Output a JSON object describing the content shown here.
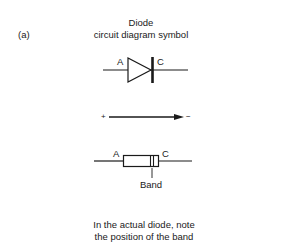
{
  "panel_label": "(a)",
  "title": {
    "line1": "Diode",
    "line2": "circuit diagram symbol"
  },
  "symbol": {
    "anode_label": "A",
    "cathode_label": "C"
  },
  "direction_arrow": {
    "plus_label": "+",
    "minus_label": "−"
  },
  "physical_diode": {
    "anode_label": "A",
    "cathode_label": "C",
    "band_label": "Band"
  },
  "caption": {
    "line1": "In the actual diode, note",
    "line2": "the position of the band"
  }
}
